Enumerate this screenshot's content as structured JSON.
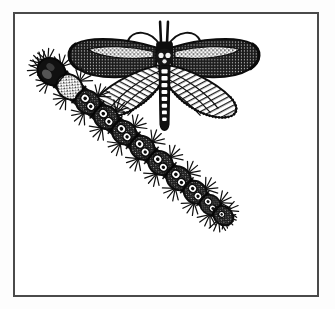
{
  "figure": {
    "kind": "scientific-illustration",
    "medium": "black-and-white pen-and-ink engraving",
    "background_color": "#ffffff",
    "page_color": "#fdfdfd",
    "ink_color": "#111111",
    "frame": {
      "color": "#4a4a4a",
      "thickness_px": 2,
      "x": 13,
      "y": 12,
      "width": 306,
      "height": 285
    },
    "caption": {
      "text": "",
      "legible": false,
      "note": "partial line of text cropped at the bottom edge of the scan"
    },
    "subjects": [
      {
        "id": "moth",
        "label": "adult moth",
        "position": "upper portion of plate, wings spread",
        "bounds": {
          "x": 75,
          "y": 20,
          "width": 225,
          "height": 110
        },
        "features": [
          "two curved antennae sweeping outward",
          "two erect labial palps between the antennae",
          "stout dark thorax",
          "segmented abdomen with pale mid-dorsal spots",
          "forewings mottled dark with a pale speckled band",
          "hindwings pale with dark radiating veins",
          "fringed wing margins"
        ]
      },
      {
        "id": "larva",
        "label": "caterpillar larva",
        "position": "diagonal from upper-left to lower-right",
        "bounds": {
          "x": 35,
          "y": 62,
          "width": 235,
          "height": 222
        },
        "features": [
          "dark rounded head capsule at upper left",
          "twelve body segments",
          "paired pale ring-shaped tubercle markings per segment",
          "dense bristles radiating from every segment",
          "tapering posterior end at lower right"
        ]
      }
    ]
  }
}
